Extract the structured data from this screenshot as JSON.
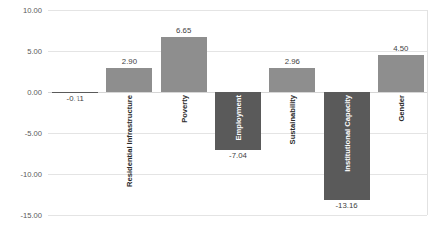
{
  "chart_data": {
    "type": "bar",
    "title": "",
    "xlabel": "",
    "ylabel": "",
    "ylim": [
      -15.0,
      10.0
    ],
    "grid": true,
    "legend": "none",
    "ytick_labels": [
      "10.00",
      "5.00",
      "0.00",
      "-5.00",
      "-10.00",
      "-15.00"
    ],
    "ytick_values": [
      10,
      5,
      0,
      -5,
      -10,
      -15
    ],
    "categories": [
      "LCN Total",
      "Residential Infrastructure",
      "Poverty",
      "Employment",
      "Sustainability",
      "Institutional Capacity",
      "Gender"
    ],
    "values": [
      -0.11,
      2.9,
      6.65,
      -7.04,
      2.96,
      -13.16,
      4.5
    ],
    "value_labels": [
      "-0.11",
      "2.90",
      "6.65",
      "-7.04",
      "2.96",
      "-13.16",
      "4.50"
    ],
    "colors": {
      "positive_bar": "#8e8e8e",
      "negative_bar": "#5a5a5a",
      "gridline": "#e4e4e4",
      "zeroline": "#d6d6d6",
      "tick_text": "#595959",
      "label_inside": "#ffffff",
      "label_outside": "#2b2b2b",
      "background": "#ffffff"
    }
  }
}
